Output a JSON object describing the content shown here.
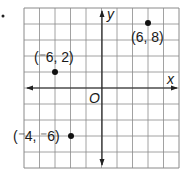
{
  "bullet": "•",
  "grid": {
    "xmin": -10,
    "xmax": 10,
    "ymin": -10,
    "ymax": 10,
    "step": 2
  },
  "axes": {
    "x_label": "x",
    "y_label": "y",
    "origin_label": "O"
  },
  "points": [
    {
      "x": 6,
      "y": 8,
      "label": "(6, 8)"
    },
    {
      "x": -6,
      "y": 2,
      "label": "(⁻6, 2)"
    },
    {
      "x": -4,
      "y": -6,
      "label": "(⁻4, ⁻6)"
    }
  ],
  "colors": {
    "grid": "#8a8a8a",
    "axis": "#222222",
    "point": "#111111"
  }
}
